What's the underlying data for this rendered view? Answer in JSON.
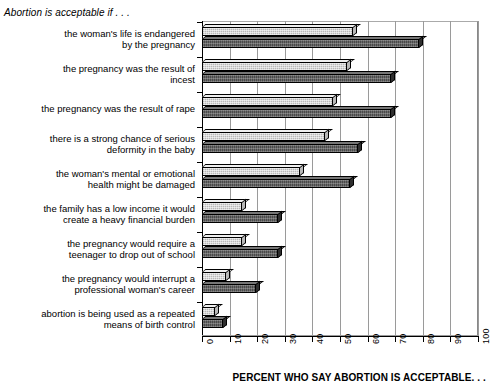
{
  "header": {
    "title": "Abortion is acceptable if . . ."
  },
  "axis": {
    "x_title": "PERCENT WHO SAY ABORTION IS ACCEPTABLE. . .",
    "x_ticks": [
      "0",
      "10",
      "20",
      "30",
      "40",
      "50",
      "60",
      "70",
      "80",
      "90",
      "100"
    ]
  },
  "chart_data": {
    "type": "bar",
    "orientation": "horizontal",
    "title": "Abortion is acceptable if . . .",
    "xlabel": "PERCENT WHO SAY ABORTION IS ACCEPTABLE. . .",
    "ylabel": "",
    "xlim": [
      0,
      100
    ],
    "grid": true,
    "legend": "none",
    "categories": [
      "the woman's life is endangered\nby the pregnancy",
      "the pregnancy was the result of\nincest",
      "the pregnancy was the result of rape",
      "there is a strong chance of serious\ndeformity in the baby",
      "the woman's mental or emotional\nhealth might be damaged",
      "the family has a low income it would\ncreate a heavy financial burden",
      "the pregnancy would require a\nteenager to drop out of school",
      "the pregnancy would interrupt a\nprofessional woman's career",
      "abortion is being used as a repeated\nmeans of birth control"
    ],
    "series": [
      {
        "name": "series-a",
        "values": [
          56,
          54,
          49,
          46,
          37,
          16,
          16,
          10,
          6
        ]
      },
      {
        "name": "series-b",
        "values": [
          80,
          70,
          70,
          58,
          55,
          29,
          29,
          21,
          9
        ]
      }
    ]
  }
}
